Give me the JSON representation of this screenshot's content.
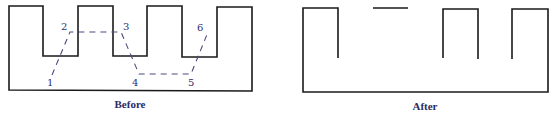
{
  "figure": {
    "type": "before-after-diagram",
    "panels": [
      {
        "id": "before",
        "caption": "Before",
        "point_labels": [
          "1",
          "2",
          "3",
          "4",
          "5",
          "6"
        ],
        "description": "Comb-shaped outline with three notches; dashed path 1-2-3-4-5-6 crosses through the teeth"
      },
      {
        "id": "after",
        "caption": "After",
        "description": "Outline after the dashed path is applied; segments of the top edge removed, leaving open teeth and a floating top segment"
      }
    ],
    "colors": {
      "outline": "#1a1a1a",
      "cut_path": "#4a4a7a",
      "label_text": "#2e2e6e",
      "caption_text": "#2a2a66",
      "background": "#ffffff"
    }
  },
  "before": {
    "caption": "Before",
    "points": {
      "p1": {
        "label": "1",
        "x": 51,
        "y": 86
      },
      "p2": {
        "label": "2",
        "x": 65,
        "y": 30
      },
      "p3": {
        "label": "3",
        "x": 127,
        "y": 30
      },
      "p4": {
        "label": "4",
        "x": 135,
        "y": 86
      },
      "p5": {
        "label": "5",
        "x": 191,
        "y": 86
      },
      "p6": {
        "label": "6",
        "x": 199,
        "y": 31
      }
    }
  },
  "after": {
    "caption": "After"
  }
}
